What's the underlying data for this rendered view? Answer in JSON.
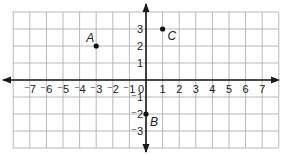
{
  "chart_data": {
    "type": "scatter",
    "title": "",
    "xlabel": "",
    "ylabel": "",
    "xlim": [
      -7,
      7
    ],
    "ylim": [
      -3,
      3
    ],
    "grid": true,
    "x_ticks": [
      "-7",
      "-6",
      "-5",
      "-4",
      "-3",
      "-2",
      "-1",
      "0",
      "1",
      "2",
      "3",
      "4",
      "5",
      "6",
      "7"
    ],
    "y_ticks": [
      "3",
      "2",
      "1",
      "-1",
      "-2",
      "-3"
    ],
    "points": [
      {
        "label": "A",
        "x": -3,
        "y": 2
      },
      {
        "label": "B",
        "x": 0,
        "y": -2
      },
      {
        "label": "C",
        "x": 1,
        "y": 3
      }
    ]
  },
  "colors": {
    "grid": "#b8b8b8",
    "axis": "#1a1a1a",
    "point": "#111111",
    "text": "#222222"
  }
}
